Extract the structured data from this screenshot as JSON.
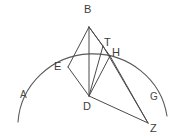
{
  "figure": {
    "type": "geometry-diagram",
    "stroke_color": "#4a4a4a",
    "background_color": "#ffffff",
    "vertex_labels": [
      {
        "id": "B",
        "text": "B",
        "x": 84,
        "y": 4
      },
      {
        "id": "T",
        "text": "T",
        "x": 104,
        "y": 37
      },
      {
        "id": "H",
        "text": "H",
        "x": 112,
        "y": 47
      },
      {
        "id": "E",
        "text": "E",
        "x": 54,
        "y": 61
      },
      {
        "id": "D",
        "text": "D",
        "x": 83,
        "y": 101
      },
      {
        "id": "Z",
        "text": "Z",
        "x": 150,
        "y": 123
      }
    ],
    "region_labels": [
      {
        "id": "A",
        "text": "A",
        "x": 20,
        "y": 90
      },
      {
        "id": "G",
        "text": "G",
        "x": 150,
        "y": 92
      }
    ],
    "points": {
      "B": {
        "x": 89,
        "y": 27
      },
      "E": {
        "x": 68,
        "y": 67
      },
      "T": {
        "x": 103,
        "y": 46
      },
      "H": {
        "x": 110,
        "y": 56
      },
      "D": {
        "x": 89,
        "y": 96
      },
      "Z": {
        "x": 148,
        "y": 123
      }
    },
    "segments": [
      {
        "name": "B-E",
        "from": "B",
        "to": "E"
      },
      {
        "name": "B-D",
        "from": "B",
        "to": "D"
      },
      {
        "name": "B-T",
        "from": "B",
        "to": "T"
      },
      {
        "name": "B-H",
        "from": "B",
        "to": "H"
      },
      {
        "name": "E-D",
        "from": "E",
        "to": "D"
      },
      {
        "name": "T-D",
        "from": "T",
        "to": "D"
      },
      {
        "name": "H-D",
        "from": "H",
        "to": "D"
      },
      {
        "name": "D-Z",
        "from": "D",
        "to": "Z"
      },
      {
        "name": "H-Z",
        "from": "H",
        "to": "Z"
      },
      {
        "name": "T-Z",
        "from": "T",
        "to": "Z"
      }
    ],
    "arc": {
      "name": "outer-arc",
      "center_x": 92,
      "center_y": 100,
      "radius_x": 75,
      "radius_y": 73,
      "start_x": 18,
      "start_y": 122,
      "end_x": 167,
      "end_y": 116
    }
  }
}
